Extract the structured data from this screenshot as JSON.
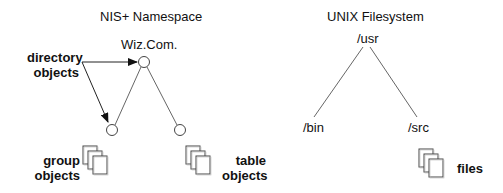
{
  "nis": {
    "title": "NIS+ Namespace",
    "root": "Wiz.Com.",
    "labels": {
      "directory_line1": "directory",
      "directory_line2": "objects",
      "group_line1": "group",
      "group_line2": "objects",
      "table_line1": "table",
      "table_line2": "objects"
    }
  },
  "unix": {
    "title": "UNIX Filesystem",
    "root": "/usr",
    "left_child": "/bin",
    "right_child": "/src",
    "files_label": "files"
  },
  "icons": {
    "node": "circle-node-icon",
    "documents": "stacked-documents-icon",
    "arrow": "arrow-icon"
  },
  "colors": {
    "line": "#555555",
    "text": "#111111",
    "doc_fill": "#ffffff",
    "doc_stroke": "#444444"
  }
}
